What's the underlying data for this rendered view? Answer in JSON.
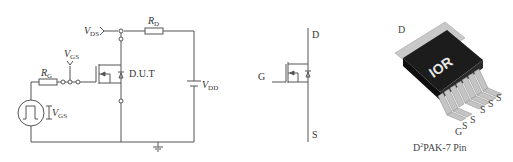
{
  "circuit": {
    "vds_label": {
      "main": "V",
      "sub": "DS"
    },
    "rd_label": {
      "main": "R",
      "sub": "D"
    },
    "vgs_top_label": {
      "main": "V",
      "sub": "GS"
    },
    "rg_label": {
      "main": "R",
      "sub": "G"
    },
    "dut_label": "D.U.T",
    "vdd_label": {
      "main": "V",
      "sub": "DD"
    },
    "vgs_source_label": {
      "main": "V",
      "sub": "GS"
    }
  },
  "symbol": {
    "drain_label": "D",
    "gate_label": "G",
    "source_label": "S"
  },
  "package": {
    "drain_label": "D",
    "logo": "IOR",
    "pin_labels": [
      "G",
      "S",
      "S",
      "S",
      "S",
      "S"
    ],
    "caption_prefix": "D",
    "caption_sup": "2",
    "caption_rest": "PAK-7 Pin"
  },
  "colors": {
    "line": "#555555",
    "package_body": "#1a1a1a",
    "package_pins": "#bdbdbd"
  }
}
